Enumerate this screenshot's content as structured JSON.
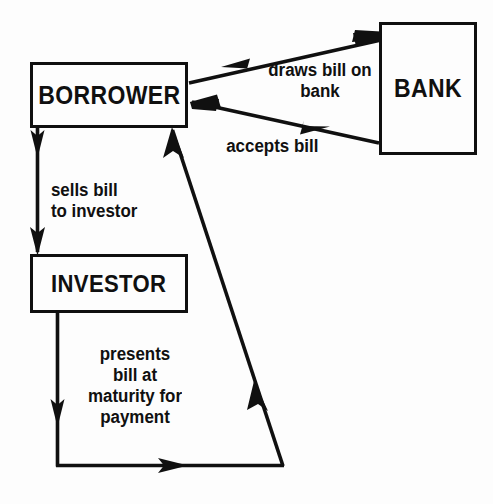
{
  "diagram": {
    "type": "flow-diagram",
    "background_color": "#fdfdfd",
    "line_color": "#101010",
    "nodes": [
      {
        "id": "borrower",
        "label": "BORROWER"
      },
      {
        "id": "bank",
        "label": "BANK"
      },
      {
        "id": "investor",
        "label": "INVESTOR"
      }
    ],
    "edges": [
      {
        "id": "draws",
        "from": "borrower",
        "to": "bank",
        "label": "draws bill on\nbank",
        "direction": "borrower-to-bank"
      },
      {
        "id": "accepts",
        "from": "bank",
        "to": "borrower",
        "label": "accepts bill",
        "direction": "bank-to-borrower"
      },
      {
        "id": "sells",
        "from": "borrower",
        "to": "investor",
        "label": "sells bill\nto investor",
        "direction": "borrower-to-investor"
      },
      {
        "id": "presents",
        "from": "investor",
        "to": "borrower",
        "label": "presents\nbill at\nmaturity for\npayment",
        "direction": "investor-to-borrower"
      }
    ]
  }
}
